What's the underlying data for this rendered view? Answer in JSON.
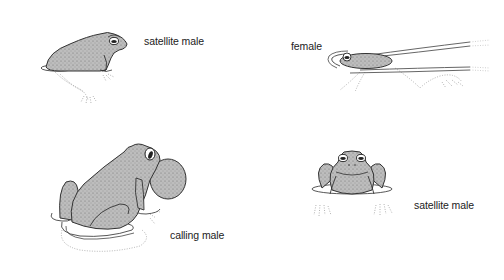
{
  "figure": {
    "panels": [
      {
        "id": "satellite-male-side",
        "label": "satellite male",
        "label_pos": {
          "x": 144,
          "y": 35
        }
      },
      {
        "id": "female-swimming",
        "label": "female",
        "label_pos": {
          "x": 291,
          "y": 40
        }
      },
      {
        "id": "calling-male",
        "label": "calling male",
        "label_pos": {
          "x": 170,
          "y": 229
        }
      },
      {
        "id": "satellite-male-front",
        "label": "satellite male",
        "label_pos": {
          "x": 414,
          "y": 199
        }
      }
    ]
  },
  "colors": {
    "body_fill": "#b9b9b9",
    "outline": "#333333",
    "water_line": "#555555",
    "submerged": "#9a9a9a",
    "background": "#ffffff"
  }
}
